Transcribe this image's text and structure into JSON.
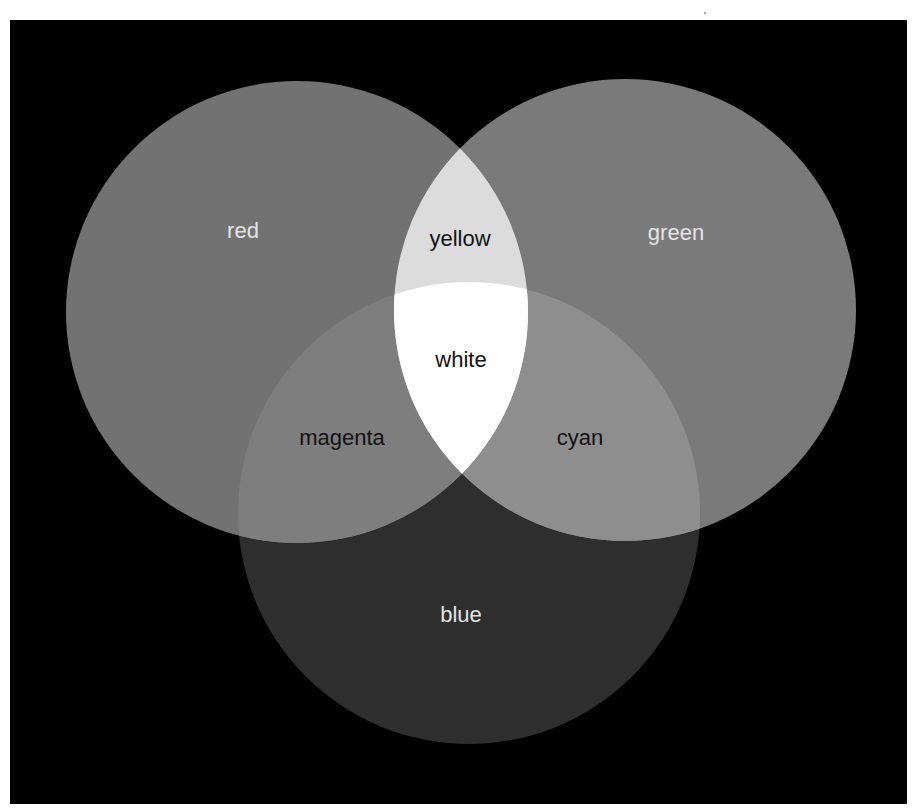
{
  "diagram": {
    "type": "additive-color-venn",
    "background": "#000000",
    "frame": {
      "x": 10,
      "y": 20,
      "width": 897,
      "height": 784
    },
    "circles": {
      "red": {
        "label": "red",
        "cx": 297,
        "cy": 312,
        "r": 231,
        "fill": "#727272",
        "label_color": "#e4e4e4",
        "label_x": 243,
        "label_y": 230
      },
      "green": {
        "label": "green",
        "cx": 625,
        "cy": 310,
        "r": 231,
        "fill": "#7a7a7a",
        "label_color": "#e4e4e4",
        "label_x": 676,
        "label_y": 232
      },
      "blue": {
        "label": "blue",
        "cx": 469,
        "cy": 513,
        "r": 231,
        "fill": "#2e2e2e",
        "label_color": "#e4e4e4",
        "label_x": 461,
        "label_y": 614
      }
    },
    "overlaps": {
      "yellow": {
        "label": "yellow",
        "sets": [
          "red",
          "green"
        ],
        "fill": "#dcdcdc",
        "label_color": "#111111",
        "label_x": 460,
        "label_y": 238
      },
      "magenta": {
        "label": "magenta",
        "sets": [
          "red",
          "blue"
        ],
        "fill": "#7e7e7e",
        "label_color": "#111111",
        "label_x": 342,
        "label_y": 437
      },
      "cyan": {
        "label": "cyan",
        "sets": [
          "green",
          "blue"
        ],
        "fill": "#8e8e8e",
        "label_color": "#111111",
        "label_x": 580,
        "label_y": 437
      },
      "white": {
        "label": "white",
        "sets": [
          "red",
          "green",
          "blue"
        ],
        "fill": "#ffffff",
        "label_color": "#111111",
        "label_x": 461,
        "label_y": 359
      }
    }
  }
}
